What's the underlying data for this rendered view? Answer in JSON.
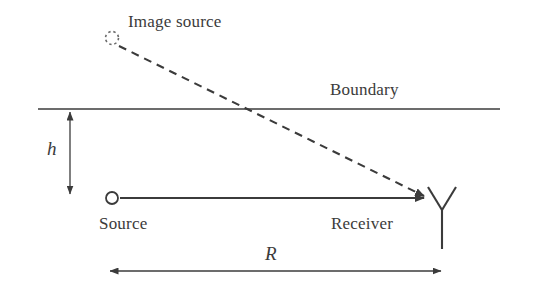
{
  "figure": {
    "type": "two-ray-propagation-diagram",
    "background_color": "#ffffff",
    "line_color": "#3b3b3b",
    "text_color": "#3b3b3b"
  },
  "labels": {
    "image_source": "Image source",
    "boundary": "Boundary",
    "height": "h",
    "source": "Source",
    "receiver": "Receiver",
    "range": "R"
  },
  "elements": {
    "image_source_marker": "dotted-circle-icon",
    "source_marker": "open-circle-icon",
    "receiver_marker": "antenna-icon",
    "direct_ray": "solid-arrow",
    "reflected_ray": "dashed-arrow",
    "boundary_line": "horizontal-line",
    "height_dimension": "vertical-double-arrow",
    "range_dimension": "horizontal-double-arrow"
  },
  "geometry": {
    "boundary_y": 109,
    "boundary_x_start": 38,
    "boundary_x_end": 500,
    "image_source_x": 112,
    "image_source_y": 38,
    "source_x": 112,
    "source_y": 198,
    "receiver_x": 442,
    "receiver_y": 198,
    "reflection_point_x": 265,
    "height_arrow_x": 70,
    "range_arrow_y": 271
  }
}
